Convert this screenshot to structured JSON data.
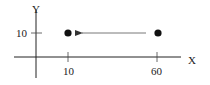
{
  "diagram": {
    "axes": {
      "x_label": "X",
      "y_label": "Y",
      "x_ticks": [
        {
          "label": "10",
          "value": 10
        },
        {
          "label": "60",
          "value": 60
        }
      ],
      "y_ticks": [
        {
          "label": "10",
          "value": 10
        }
      ]
    },
    "points": [
      {
        "name": "left-point",
        "x": 10,
        "y": 10
      },
      {
        "name": "right-point",
        "x": 60,
        "y": 10
      }
    ],
    "arrow": {
      "from": [
        60,
        10
      ],
      "to": [
        10,
        10
      ],
      "direction": "left"
    },
    "colors": {
      "ink": "#222222",
      "arrow": "#555555"
    }
  }
}
